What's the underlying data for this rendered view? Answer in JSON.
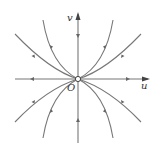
{
  "diagram": {
    "type": "phase-portrait",
    "labels": {
      "vertical_axis": "v",
      "horizontal_axis": "u",
      "origin": "O"
    },
    "line_color": "#666666",
    "arrow_direction": "toward-origin"
  }
}
